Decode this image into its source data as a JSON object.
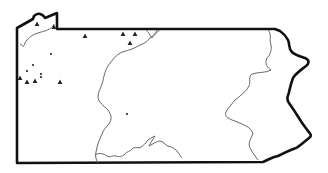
{
  "map": {
    "region": "Pennsylvania",
    "background": "#ffffff",
    "border_color": "#111111",
    "river_color": "#555555",
    "marker_color": "#222222",
    "legend": {
      "triangle": "site (triangle marker)",
      "dot": "site (dot marker)"
    },
    "markers": {
      "triangles": [
        {
          "x": 37,
          "y": 24
        },
        {
          "x": 54,
          "y": 27
        },
        {
          "x": 85,
          "y": 36
        },
        {
          "x": 123,
          "y": 34
        },
        {
          "x": 135,
          "y": 34
        },
        {
          "x": 130,
          "y": 43
        },
        {
          "x": 20,
          "y": 78
        },
        {
          "x": 27,
          "y": 82
        },
        {
          "x": 35,
          "y": 81
        },
        {
          "x": 60,
          "y": 82
        }
      ],
      "dots": [
        {
          "x": 51,
          "y": 54
        },
        {
          "x": 33,
          "y": 65
        },
        {
          "x": 27,
          "y": 71
        },
        {
          "x": 41,
          "y": 74
        },
        {
          "x": 41,
          "y": 77
        },
        {
          "x": 127,
          "y": 114
        }
      ]
    }
  }
}
